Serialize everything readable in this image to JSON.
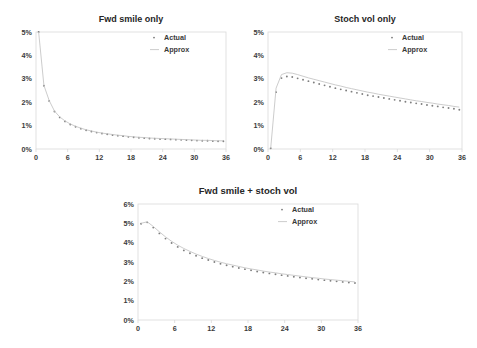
{
  "figure": {
    "background": "#ffffff",
    "panel_count": 3
  },
  "legend": {
    "actual_label": "Actual",
    "approx_label": "Approx",
    "actual_color": "#7f7f7f",
    "approx_color": "#c6c6c6",
    "position": "top-right"
  },
  "chart_data": [
    {
      "id": "fwd-smile-only",
      "type": "scatter",
      "title": "Fwd smile only",
      "xlabel": "",
      "ylabel": "",
      "xlim": [
        0,
        36
      ],
      "ylim": [
        0,
        0.05
      ],
      "xticks": [
        0,
        6,
        12,
        18,
        24,
        30,
        36
      ],
      "xtick_labels": [
        "0",
        "6",
        "12",
        "18",
        "24",
        "30",
        "36"
      ],
      "yticks": [
        0,
        0.01,
        0.02,
        0.03,
        0.04,
        0.05
      ],
      "ytick_labels": [
        "0%",
        "1%",
        "2%",
        "3%",
        "4%",
        "5%"
      ],
      "grid": false,
      "legend": [
        "Actual",
        "Approx"
      ],
      "series": [
        {
          "name": "Actual",
          "style": "dots",
          "x": [
            0.5,
            1.5,
            2.5,
            3.5,
            4.5,
            5.5,
            6.5,
            7.5,
            8.5,
            9.5,
            10.5,
            11.5,
            12.5,
            13.5,
            14.5,
            15.5,
            16.5,
            17.5,
            18.5,
            19.5,
            20.5,
            21.5,
            22.5,
            23.5,
            24.5,
            25.5,
            26.5,
            27.5,
            28.5,
            29.5,
            30.5,
            31.5,
            32.5,
            33.5,
            34.5,
            35.5
          ],
          "y": [
            0.05,
            0.027,
            0.0205,
            0.016,
            0.0135,
            0.0118,
            0.0105,
            0.0095,
            0.0087,
            0.008,
            0.0075,
            0.007,
            0.0066,
            0.0063,
            0.006,
            0.0057,
            0.0055,
            0.0052,
            0.005,
            0.0048,
            0.0047,
            0.0045,
            0.0044,
            0.0043,
            0.0042,
            0.0041,
            0.004,
            0.0039,
            0.0038,
            0.0037,
            0.0036,
            0.0035,
            0.0035,
            0.0034,
            0.0033,
            0.0033
          ]
        },
        {
          "name": "Approx",
          "style": "line",
          "x": [
            0.5,
            1.5,
            2.5,
            3.5,
            4.5,
            5.5,
            6.5,
            7.5,
            8.5,
            9.5,
            10.5,
            11.5,
            12.5,
            13.5,
            14.5,
            15.5,
            16.5,
            17.5,
            18.5,
            19.5,
            20.5,
            21.5,
            22.5,
            23.5,
            24.5,
            25.5,
            26.5,
            27.5,
            28.5,
            29.5,
            30.5,
            31.5,
            32.5,
            33.5,
            34.5,
            35.5
          ],
          "y": [
            0.05,
            0.0272,
            0.0207,
            0.0162,
            0.0137,
            0.012,
            0.0107,
            0.0097,
            0.0089,
            0.0082,
            0.0077,
            0.0072,
            0.0068,
            0.0065,
            0.0062,
            0.0059,
            0.0057,
            0.0054,
            0.0052,
            0.005,
            0.0049,
            0.0047,
            0.0046,
            0.0045,
            0.0044,
            0.0043,
            0.0042,
            0.0041,
            0.004,
            0.0039,
            0.0038,
            0.0037,
            0.0037,
            0.0036,
            0.0035,
            0.0035
          ]
        }
      ]
    },
    {
      "id": "stoch-vol-only",
      "type": "scatter",
      "title": "Stoch vol only",
      "xlabel": "",
      "ylabel": "",
      "xlim": [
        0,
        36
      ],
      "ylim": [
        0,
        0.05
      ],
      "xticks": [
        0,
        6,
        12,
        18,
        24,
        30,
        36
      ],
      "xtick_labels": [
        "0",
        "6",
        "12",
        "18",
        "24",
        "30",
        "36"
      ],
      "yticks": [
        0,
        0.01,
        0.02,
        0.03,
        0.04,
        0.05
      ],
      "ytick_labels": [
        "0%",
        "1%",
        "2%",
        "3%",
        "4%",
        "5%"
      ],
      "grid": false,
      "legend": [
        "Actual",
        "Approx"
      ],
      "series": [
        {
          "name": "Actual",
          "style": "dots",
          "x": [
            0.5,
            1.5,
            2.5,
            3.5,
            4.5,
            5.5,
            6.5,
            7.5,
            8.5,
            9.5,
            10.5,
            11.5,
            12.5,
            13.5,
            14.5,
            15.5,
            16.5,
            17.5,
            18.5,
            19.5,
            20.5,
            21.5,
            22.5,
            23.5,
            24.5,
            25.5,
            26.5,
            27.5,
            28.5,
            29.5,
            30.5,
            31.5,
            32.5,
            33.5,
            34.5,
            35.5
          ],
          "y": [
            0.0003,
            0.0243,
            0.0303,
            0.031,
            0.0308,
            0.0302,
            0.0296,
            0.029,
            0.0284,
            0.0278,
            0.0272,
            0.0266,
            0.026,
            0.0255,
            0.025,
            0.0245,
            0.024,
            0.0235,
            0.023,
            0.0226,
            0.0222,
            0.0218,
            0.0214,
            0.021,
            0.0206,
            0.0202,
            0.0199,
            0.0195,
            0.0192,
            0.0188,
            0.0185,
            0.0182,
            0.0178,
            0.0175,
            0.0172,
            0.0168
          ]
        },
        {
          "name": "Approx",
          "style": "line",
          "x": [
            0.5,
            1.5,
            2.5,
            3.5,
            4.5,
            5.5,
            6.5,
            7.5,
            8.5,
            9.5,
            10.5,
            11.5,
            12.5,
            13.5,
            14.5,
            15.5,
            16.5,
            17.5,
            18.5,
            19.5,
            20.5,
            21.5,
            22.5,
            23.5,
            24.5,
            25.5,
            26.5,
            27.5,
            28.5,
            29.5,
            30.5,
            31.5,
            32.5,
            33.5,
            34.5,
            35.5
          ],
          "y": [
            0.0003,
            0.026,
            0.0318,
            0.0326,
            0.0324,
            0.0318,
            0.0311,
            0.0304,
            0.0298,
            0.0292,
            0.0286,
            0.028,
            0.0274,
            0.0269,
            0.0263,
            0.0258,
            0.0253,
            0.0248,
            0.0243,
            0.0239,
            0.0234,
            0.023,
            0.0226,
            0.0222,
            0.0218,
            0.0214,
            0.021,
            0.0206,
            0.0203,
            0.0199,
            0.0196,
            0.0192,
            0.0189,
            0.0186,
            0.0182,
            0.0179
          ]
        }
      ]
    },
    {
      "id": "fwd-smile-plus-stoch-vol",
      "type": "scatter",
      "title": "Fwd smile + stoch vol",
      "xlabel": "",
      "ylabel": "",
      "xlim": [
        0,
        36
      ],
      "ylim": [
        0,
        0.06
      ],
      "xticks": [
        0,
        6,
        12,
        18,
        24,
        30,
        36
      ],
      "xtick_labels": [
        "0",
        "6",
        "12",
        "18",
        "24",
        "30",
        "36"
      ],
      "yticks": [
        0,
        0.01,
        0.02,
        0.03,
        0.04,
        0.05,
        0.06
      ],
      "ytick_labels": [
        "0%",
        "1%",
        "2%",
        "3%",
        "4%",
        "5%",
        "6%"
      ],
      "grid": false,
      "legend": [
        "Actual",
        "Approx"
      ],
      "series": [
        {
          "name": "Actual",
          "style": "dots",
          "x": [
            0.5,
            1.5,
            2.5,
            3.5,
            4.5,
            5.5,
            6.5,
            7.5,
            8.5,
            9.5,
            10.5,
            11.5,
            12.5,
            13.5,
            14.5,
            15.5,
            16.5,
            17.5,
            18.5,
            19.5,
            20.5,
            21.5,
            22.5,
            23.5,
            24.5,
            25.5,
            26.5,
            27.5,
            28.5,
            29.5,
            30.5,
            31.5,
            32.5,
            33.5,
            34.5,
            35.5
          ],
          "y": [
            0.0498,
            0.0505,
            0.0478,
            0.0448,
            0.0421,
            0.0398,
            0.0378,
            0.036,
            0.0345,
            0.0332,
            0.032,
            0.031,
            0.03,
            0.0291,
            0.0283,
            0.0276,
            0.0269,
            0.0263,
            0.0257,
            0.0251,
            0.0246,
            0.0241,
            0.0237,
            0.0232,
            0.0228,
            0.0224,
            0.022,
            0.0216,
            0.0213,
            0.0209,
            0.0206,
            0.0203,
            0.02,
            0.0197,
            0.0194,
            0.0191
          ]
        },
        {
          "name": "Approx",
          "style": "line",
          "x": [
            0.5,
            1.5,
            2.5,
            3.5,
            4.5,
            5.5,
            6.5,
            7.5,
            8.5,
            9.5,
            10.5,
            11.5,
            12.5,
            13.5,
            14.5,
            15.5,
            16.5,
            17.5,
            18.5,
            19.5,
            20.5,
            21.5,
            22.5,
            23.5,
            24.5,
            25.5,
            26.5,
            27.5,
            28.5,
            29.5,
            30.5,
            31.5,
            32.5,
            33.5,
            34.5,
            35.5
          ],
          "y": [
            0.05,
            0.0508,
            0.0484,
            0.0456,
            0.043,
            0.0407,
            0.0387,
            0.037,
            0.0355,
            0.0341,
            0.0329,
            0.0318,
            0.0308,
            0.0299,
            0.0291,
            0.0284,
            0.0277,
            0.027,
            0.0264,
            0.0259,
            0.0253,
            0.0248,
            0.0244,
            0.0239,
            0.0235,
            0.0231,
            0.0227,
            0.0223,
            0.0219,
            0.0216,
            0.0212,
            0.0209,
            0.0206,
            0.0203,
            0.02,
            0.0197
          ]
        }
      ]
    }
  ]
}
